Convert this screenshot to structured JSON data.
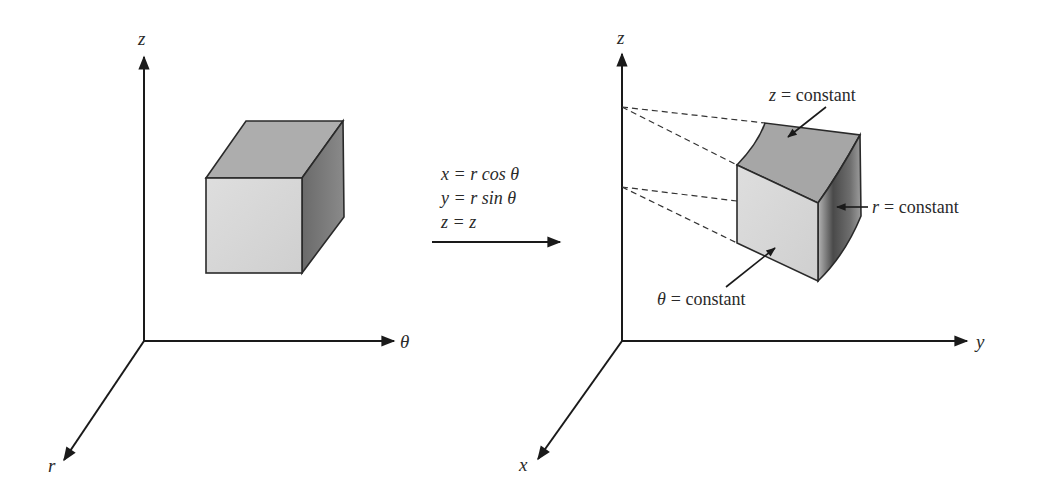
{
  "figure": {
    "left_panel": {
      "axes": {
        "vertical": "z",
        "horizontal": "θ",
        "depth": "r"
      },
      "shape": "rectangular box"
    },
    "transform": {
      "equations": [
        {
          "lhs": "x",
          "eq": "=",
          "rhs_var": "r",
          "rhs_func": "cos",
          "rhs_arg": "θ"
        },
        {
          "lhs": "y",
          "eq": "=",
          "rhs_var": "r",
          "rhs_func": "sin",
          "rhs_arg": "θ"
        },
        {
          "lhs": "z",
          "eq": "=",
          "rhs_var": "z",
          "rhs_func": "",
          "rhs_arg": ""
        }
      ],
      "line1": "x = r cos θ",
      "line2": "y = r sin θ",
      "line3": "z = z"
    },
    "right_panel": {
      "axes": {
        "vertical": "z",
        "horizontal": "y",
        "depth": "x"
      },
      "shape": "cylindrical wedge element",
      "annotations": {
        "top": {
          "var": "z",
          "text": "= constant"
        },
        "side": {
          "var": "r",
          "text": "= constant"
        },
        "front": {
          "var": "θ",
          "text": "= constant"
        }
      }
    },
    "colors": {
      "ink": "#1a1a1a",
      "front_face": "#d6d6d6",
      "top_face": "#a9a9a9",
      "side_face_dark": "#555555",
      "side_face_light": "#9a9a9a"
    }
  }
}
